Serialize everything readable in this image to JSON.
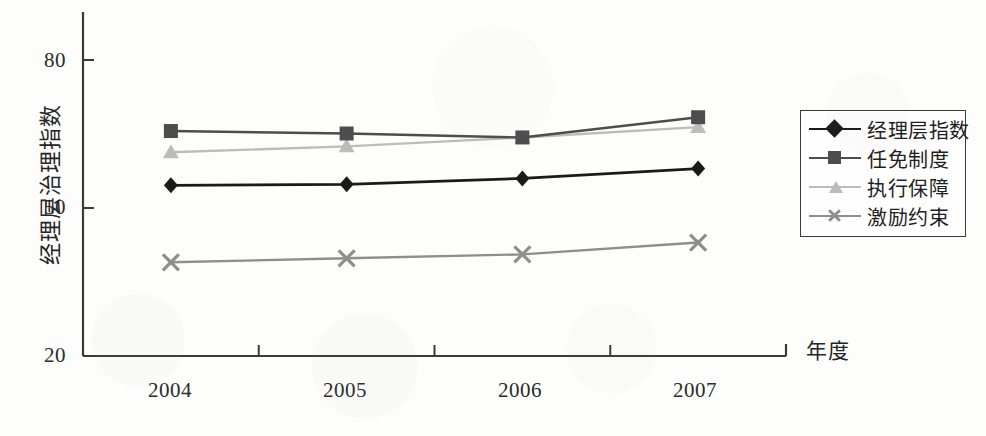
{
  "chart_data": {
    "type": "line",
    "title": "",
    "xlabel": "年度",
    "ylabel": "经理层治理指数",
    "categories": [
      "2004",
      "2005",
      "2006",
      "2007"
    ],
    "ylim": [
      20,
      80
    ],
    "yticks": [
      20,
      50,
      80
    ],
    "ytick_labels": [
      "20",
      "50",
      "80"
    ],
    "grid": false,
    "legend_position": "right",
    "series": [
      {
        "name": "经理层指数",
        "marker": "diamond",
        "color": "#1a1a1a",
        "values": [
          54.6,
          54.8,
          56.0,
          58.0
        ]
      },
      {
        "name": "任免制度",
        "marker": "square",
        "color": "#4d4d4d",
        "values": [
          65.6,
          65.1,
          64.3,
          68.4
        ]
      },
      {
        "name": "执行保障",
        "marker": "triangle",
        "color": "#bcbcbc",
        "values": [
          61.3,
          62.5,
          64.3,
          66.4
        ]
      },
      {
        "name": "激励约束",
        "marker": "x",
        "color": "#8e8e8e",
        "values": [
          39.0,
          39.8,
          40.6,
          43.0
        ]
      }
    ]
  },
  "axis": {
    "y_title": "经理层治理指数",
    "x_title": "年度",
    "y_labels": [
      "80",
      "50",
      "20"
    ],
    "x_labels": [
      "2004",
      "2005",
      "2006",
      "2007"
    ]
  },
  "legend": {
    "items": [
      {
        "label": "经理层指数"
      },
      {
        "label": "任免制度"
      },
      {
        "label": "执行保障"
      },
      {
        "label": "激励约束"
      }
    ]
  },
  "colors": {
    "series_1": "#1a1a1a",
    "series_2": "#4d4d4d",
    "series_3": "#bcbcbc",
    "series_4": "#8e8e8e",
    "axis": "#3a3a3a",
    "background": "#fdfdfc"
  }
}
